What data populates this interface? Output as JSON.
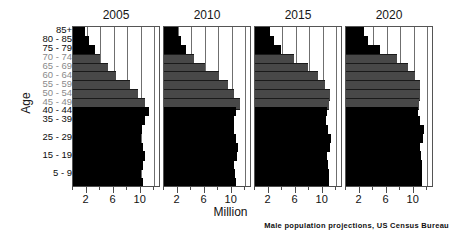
{
  "chart_data": {
    "type": "bar",
    "title": "",
    "subtitle": "",
    "xlabel": "Million",
    "ylabel": "Age",
    "credit": "Male population projections, US Census Bureau",
    "orientation": "horizontal",
    "grid": true,
    "legend": false,
    "xlim": [
      0,
      13
    ],
    "xticks_major": [
      2,
      6,
      10
    ],
    "xticks_minor": [
      0,
      4,
      8,
      12
    ],
    "xtick_labels": [
      "2",
      "6",
      "10"
    ],
    "gridlines_at": [
      2,
      4,
      6,
      8,
      10,
      12
    ],
    "categories": [
      "85+",
      "80 - 85",
      "75 - 79",
      "70 - 74",
      "65 - 69",
      "60 - 64",
      "55 - 59",
      "50 - 54",
      "45 - 49",
      "40 - 44",
      "35 - 39",
      "30 - 34",
      "25 - 29",
      "20 - 24",
      "15 - 19",
      "10 - 14",
      "5 - 9",
      "0 - 4"
    ],
    "visible_category_labels": [
      "85+",
      "80 - 85",
      "75 - 79",
      "70 - 74",
      "65 - 69",
      "60 - 64",
      "55 - 59",
      "50 - 54",
      "45 - 49",
      "40 - 44",
      "35 - 39",
      "25 - 29",
      "15 - 19",
      "5 - 9"
    ],
    "colors": {
      "bar_dark": "#000000",
      "bar_gray": "#484848",
      "axis": "#4d4d4d",
      "grid": "#6f6f6f",
      "background": "#ffffff"
    },
    "series": [
      {
        "name": "2005",
        "gray_categories": [
          "70 - 74",
          "65 - 69",
          "60 - 64",
          "55 - 59",
          "50 - 54",
          "45 - 49"
        ],
        "values": [
          1.7,
          2.3,
          3.3,
          4.0,
          5.1,
          6.4,
          8.4,
          9.6,
          10.6,
          11.3,
          10.6,
          10.2,
          10.1,
          10.4,
          10.6,
          10.4,
          10.1,
          10.3
        ]
      },
      {
        "name": "2010",
        "gray_categories": [
          "70 - 74",
          "65 - 69",
          "60 - 64",
          "55 - 59",
          "50 - 54",
          "45 - 49"
        ],
        "values": [
          2.0,
          2.5,
          3.2,
          4.5,
          6.0,
          8.1,
          9.4,
          10.4,
          11.2,
          10.7,
          10.4,
          10.3,
          10.7,
          10.9,
          10.8,
          10.4,
          10.5,
          10.7
        ]
      },
      {
        "name": "2015",
        "gray_categories": [
          "70 - 74",
          "65 - 69",
          "60 - 64",
          "55 - 59",
          "50 - 54",
          "45 - 49"
        ],
        "values": [
          2.2,
          2.8,
          3.8,
          5.8,
          7.9,
          9.3,
          10.3,
          11.1,
          10.9,
          10.6,
          10.5,
          10.8,
          11.2,
          11.1,
          10.7,
          10.8,
          11.0,
          11.0
        ]
      },
      {
        "name": "2020",
        "gray_categories": [
          "70 - 74",
          "65 - 69",
          "60 - 64",
          "55 - 59",
          "50 - 54",
          "45 - 49"
        ],
        "values": [
          2.6,
          3.3,
          5.0,
          7.6,
          9.1,
          10.2,
          11.0,
          11.0,
          10.8,
          10.7,
          11.0,
          11.5,
          11.4,
          11.0,
          11.1,
          11.3,
          11.3,
          11.2
        ]
      }
    ]
  },
  "axis": {
    "y_title": "Age",
    "x_title": "Million"
  },
  "footer": {
    "credit": "Male population projections, US Census Bureau"
  }
}
